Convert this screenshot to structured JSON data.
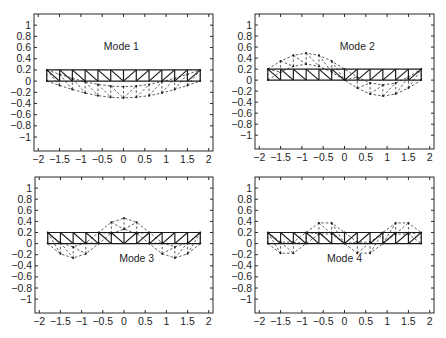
{
  "figure": {
    "layout": "2x2 grid"
  },
  "chart_data": [
    {
      "type": "line",
      "panel": "top-left",
      "label": "Mode 1",
      "label_pos": [
        -0.05,
        0.55
      ],
      "box_px": [
        34,
        14,
        213,
        151
      ],
      "xlim": [
        -2.1,
        2.1
      ],
      "ylim": [
        -1.25,
        1.2
      ],
      "xticks": [
        -2,
        -1.5,
        -1,
        -0.5,
        0,
        0.5,
        1,
        1.5,
        2
      ],
      "xtick_labels": [
        "−2",
        "−1.5",
        "−1",
        "−0.5",
        "0",
        "0.5",
        "1",
        "1.5",
        "2"
      ],
      "yticks": [
        1,
        0.8,
        0.6,
        0.4,
        0.2,
        0,
        -0.2,
        -0.4,
        -0.6,
        -0.8,
        -1
      ],
      "ytick_labels": [
        "1",
        "0.8",
        "0.6",
        "0.4",
        "0.2",
        "0",
        "−0.2",
        "−0.4",
        "−0.6",
        "−0.8",
        "−1"
      ],
      "truss": {
        "x_start": -1.8,
        "x_end": 1.8,
        "bays": 12,
        "bottom_y": 0,
        "top_y": 0.2
      },
      "mode_shape": {
        "description": "single half-sine, downward",
        "amplitude": -0.3,
        "half_waves": 1
      },
      "grid": false
    },
    {
      "type": "line",
      "panel": "top-right",
      "label": "Mode 2",
      "label_pos": [
        0.3,
        0.55
      ],
      "box_px": [
        255,
        14,
        434,
        149
      ],
      "xlim": [
        -2.1,
        2.1
      ],
      "ylim": [
        -1.25,
        1.2
      ],
      "xticks": [
        -2,
        -1.5,
        -1,
        -0.5,
        0,
        0.5,
        1,
        1.5,
        2
      ],
      "xtick_labels": [
        "−2",
        "−1.5",
        "−1",
        "−0.5",
        "0",
        "0.5",
        "1",
        "1.5",
        "2"
      ],
      "yticks": [
        1,
        0.8,
        0.6,
        0.4,
        0.2,
        0,
        -0.2,
        -0.4,
        -0.6,
        -0.8,
        -1
      ],
      "ytick_labels": [
        "1",
        "0.8",
        "0.6",
        "0.4",
        "0.2",
        "0",
        "−0.2",
        "−0.4",
        "−0.6",
        "−0.8",
        "−1"
      ],
      "truss": {
        "x_start": -1.8,
        "x_end": 1.8,
        "bays": 12,
        "bottom_y": 0,
        "top_y": 0.2
      },
      "mode_shape": {
        "description": "full sine, up left / down right",
        "amplitude": 0.29,
        "half_waves": 2
      },
      "grid": false
    },
    {
      "type": "line",
      "panel": "bottom-left",
      "label": "Mode 3",
      "label_pos": [
        0.3,
        -0.33
      ],
      "box_px": [
        35,
        177,
        213,
        313
      ],
      "xlim": [
        -2.1,
        2.1
      ],
      "ylim": [
        -1.25,
        1.2
      ],
      "xticks": [
        -2,
        -1.5,
        -1,
        -0.5,
        0,
        0.5,
        1,
        1.5,
        2
      ],
      "xtick_labels": [
        "−2",
        "−1.5",
        "−1",
        "−0.5",
        "0",
        "0.5",
        "1",
        "1.5",
        "2"
      ],
      "yticks": [
        1,
        0.8,
        0.6,
        0.4,
        0.2,
        0,
        -0.2,
        -0.4,
        -0.6,
        -0.8,
        -1
      ],
      "ytick_labels": [
        "1",
        "0.8",
        "0.6",
        "0.4",
        "0.2",
        "0",
        "−0.2",
        "−0.4",
        "−0.6",
        "−0.8",
        "−1"
      ],
      "truss": {
        "x_start": -1.8,
        "x_end": 1.8,
        "bays": 12,
        "bottom_y": 0,
        "top_y": 0.2
      },
      "mode_shape": {
        "description": "1.5 sine waves, down-up-down",
        "amplitude": -0.26,
        "half_waves": 3
      },
      "grid": false
    },
    {
      "type": "line",
      "panel": "bottom-right",
      "label": "Mode 4",
      "label_pos": [
        0.0,
        -0.33
      ],
      "box_px": [
        255,
        177,
        434,
        313
      ],
      "xlim": [
        -2.1,
        2.1
      ],
      "ylim": [
        -1.25,
        1.2
      ],
      "xticks": [
        -2,
        -1.5,
        -1,
        -0.5,
        0,
        0.5,
        1,
        1.5,
        2
      ],
      "xtick_labels": [
        "−2",
        "−1.5",
        "−1",
        "−0.5",
        "0",
        "0.5",
        "1",
        "1.5",
        "2"
      ],
      "yticks": [
        1,
        0.8,
        0.6,
        0.4,
        0.2,
        0,
        -0.2,
        -0.4,
        -0.6,
        -0.8,
        -1
      ],
      "ytick_labels": [
        "1",
        "0.8",
        "0.6",
        "0.4",
        "0.2",
        "0",
        "−0.2",
        "−0.4",
        "−0.6",
        "−0.8",
        "−1"
      ],
      "truss": {
        "x_start": -1.8,
        "x_end": 1.8,
        "bays": 12,
        "bottom_y": 0,
        "top_y": 0.2
      },
      "mode_shape": {
        "description": "2 full sine waves, down-up-down-up",
        "amplitude": -0.2,
        "half_waves": 4
      },
      "grid": false
    }
  ]
}
